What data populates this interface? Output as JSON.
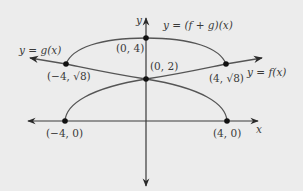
{
  "diagram": {
    "title": "",
    "colors": {
      "background": "#ececec",
      "axis": "#3a3a3a",
      "curve": "#555555",
      "point": "#111111",
      "text": "#3a3a3a"
    },
    "axes": {
      "x_label": "x",
      "y_label": "y"
    },
    "curves": [
      {
        "name": "f",
        "label": "y = f(x)",
        "description": "f(x) = sqrt(x + 4), starts at (-4, 0), passes (0, 2), (4, √8), arrow to the right"
      },
      {
        "name": "g",
        "label": "y = g(x)",
        "description": "g(x) = sqrt(4 - x), ends at (4, 0), passes (0, 2), (-4, √8), arrow to the left"
      },
      {
        "name": "f_plus_g",
        "label": "y = (f + g)(x)",
        "description": "sum curve from (-4, √8) through (0, 4) to (4, √8)"
      }
    ],
    "points": [
      {
        "label": "(0, 4)"
      },
      {
        "label": "(0, 2)"
      },
      {
        "label": "(−4, √8)"
      },
      {
        "label": "(4, √8)"
      },
      {
        "label": "(−4, 0)"
      },
      {
        "label": "(4, 0)"
      }
    ]
  }
}
